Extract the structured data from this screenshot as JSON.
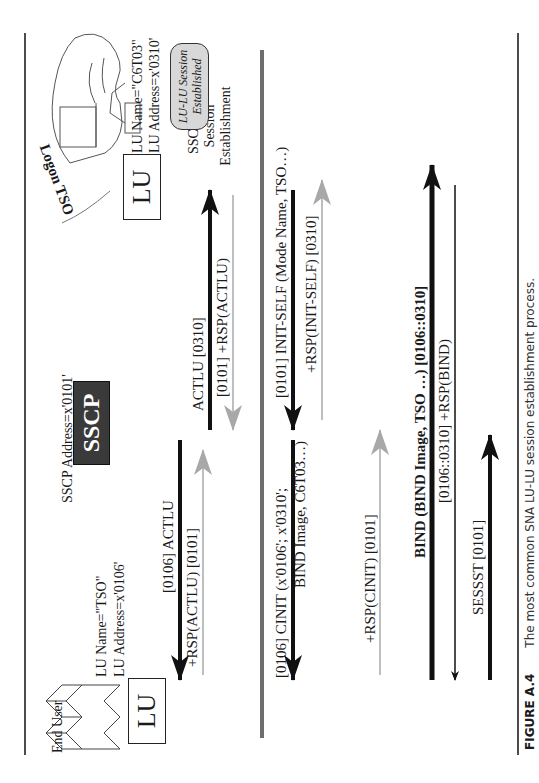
{
  "figure": {
    "label": "FIGURE A.4",
    "caption": "The most common SNA LU-LU session establishment process."
  },
  "left_node": {
    "group_label": "End User",
    "box_label": "LU",
    "lu_name": "LU Name=\"TSO\"",
    "lu_address": "LU Address=x'0106'"
  },
  "sscp_node": {
    "address": "SSCP Address=x'0101'",
    "box_label": "SSCP"
  },
  "right_node": {
    "action_label": "Logon TSO",
    "box_label": "LU",
    "lu_name": "LU Name=\"C6T03\"",
    "lu_address": "LU Address=x'0310'"
  },
  "phase_label": {
    "line1": "SSCP-LU",
    "line2": "Session",
    "line3": "Establishment"
  },
  "status_badge": {
    "line1": "LU-LU Session",
    "line2": "Established"
  },
  "messages": [
    {
      "id": "actlu_left",
      "label": "[0106] ACTLU",
      "direction": "SSCP->LU(TSO)",
      "style": "black"
    },
    {
      "id": "rsp_actlu_left",
      "label": "+RSP(ACTLU) [0101]",
      "direction": "LU(TSO)->SSCP",
      "style": "gray"
    },
    {
      "id": "actlu_right",
      "label": "ACTLU [0310]",
      "direction": "SSCP->LU(C6T03)",
      "style": "black"
    },
    {
      "id": "rsp_actlu_right",
      "label": "[0101] +RSP(ACTLU)",
      "direction": "LU(C6T03)->SSCP",
      "style": "gray"
    },
    {
      "id": "init_self",
      "label": "[0101] INIT-SELF (Mode Name, TSO…)",
      "direction": "LU(C6T03)->SSCP",
      "style": "black"
    },
    {
      "id": "rsp_init_self",
      "label": "+RSP(INIT-SELF) [0310]",
      "direction": "SSCP->LU(C6T03)",
      "style": "gray"
    },
    {
      "id": "cinit",
      "label": "[0106] CINIT (x'0106'; x'0310';",
      "label2": "BIND Image, C6T03…)",
      "direction": "SSCP->LU(TSO)",
      "style": "black"
    },
    {
      "id": "rsp_cinit",
      "label": "+RSP(CINIT) [0101]",
      "direction": "LU(TSO)->SSCP",
      "style": "gray"
    },
    {
      "id": "bind",
      "label": "BIND (BIND Image, TSO …) [0106::0310]",
      "direction": "LU(TSO)->LU(C6T03)",
      "style": "bold"
    },
    {
      "id": "rsp_bind",
      "label": "[0106::0310] +RSP(BIND)",
      "direction": "LU(C6T03)->LU(TSO)",
      "style": "thin"
    },
    {
      "id": "sessst",
      "label": "SESSST [0101]",
      "direction": "LU(TSO)->SSCP",
      "style": "black"
    }
  ],
  "colors": {
    "black_arrow": "#111111",
    "gray_arrow": "#a8a8a8",
    "divider_gray": "#6e6e6e",
    "sscp_fill": "#3a3a3a",
    "badge_fill": "#d8d8d8"
  }
}
